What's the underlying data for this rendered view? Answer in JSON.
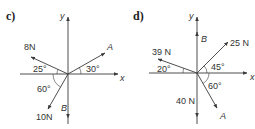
{
  "diagrams": [
    {
      "part_label": "c)",
      "axis_labels": {
        "x": "x",
        "y": "y"
      },
      "forces": [
        {
          "label": "8 N",
          "direction": "up-left",
          "angle_deg_from_negative_x": 25
        },
        {
          "label": "A",
          "direction": "up-right",
          "angle_deg_from_positive_x": 30
        },
        {
          "label": "10 N",
          "direction": "down-left",
          "angle_deg_from_negative_x_measured_downward": 60
        },
        {
          "label": "B",
          "direction": "down",
          "along": "negative y"
        }
      ],
      "angle_labels": [
        "25°",
        "30°",
        "60°"
      ],
      "text": {
        "f1": "8N",
        "f2": "A",
        "f3": "10N",
        "f4": "B",
        "a1": "25°",
        "a2": "30°",
        "a3": "60°"
      }
    },
    {
      "part_label": "d)",
      "axis_labels": {
        "x": "x",
        "y": "y"
      },
      "forces": [
        {
          "label": "39 N",
          "direction": "up-left",
          "angle_deg_from_negative_x": 20
        },
        {
          "label": "25 N",
          "direction": "up-right",
          "angle_deg_from_positive_x": 45
        },
        {
          "label": "A",
          "direction": "down-right",
          "angle_deg_from_positive_x_measured_downward": 60
        },
        {
          "label": "40 N",
          "direction": "down",
          "along": "negative y"
        },
        {
          "label": "B",
          "direction": "up",
          "along": "positive y"
        }
      ],
      "angle_labels": [
        "20°",
        "45°",
        "60°"
      ],
      "text": {
        "f1": "39 N",
        "f2": "25 N",
        "f3": "A",
        "f4": "40 N",
        "f5": "B",
        "a1": "20°",
        "a2": "45°",
        "a3": "60°"
      }
    }
  ]
}
